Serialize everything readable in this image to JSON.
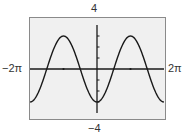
{
  "chart_data": {
    "type": "line",
    "title": "",
    "function": "y = -3cos(x)",
    "xlabel": "",
    "ylabel": "",
    "xlim": [
      -6.2832,
      6.2832
    ],
    "ylim": [
      -4,
      4
    ],
    "xlim_labels": {
      "min": "−2π",
      "max": "2π"
    },
    "ylim_labels": {
      "min": "−4",
      "max": "4"
    },
    "x_ticks": [
      "−π",
      "π"
    ],
    "y_ticks": [
      -3,
      -2,
      -1,
      1,
      2,
      3
    ],
    "grid": false,
    "legend": null,
    "series": [
      {
        "name": "y = -3cos(x)",
        "x": [
          -6.2832,
          -4.7124,
          -3.1416,
          -1.5708,
          0,
          1.5708,
          3.1416,
          4.7124,
          6.2832
        ],
        "values": [
          -3,
          0,
          3,
          0,
          -3,
          0,
          3,
          0,
          -3
        ]
      }
    ],
    "colors": {
      "frame_bg": "#f0f0f0",
      "frame_border": "#888888",
      "curve": "#1a1a1a",
      "axis": "#1a1a1a"
    }
  },
  "labels": {
    "y_max": "4",
    "y_min": "−4",
    "x_min": "−2π",
    "x_max": "2π"
  }
}
